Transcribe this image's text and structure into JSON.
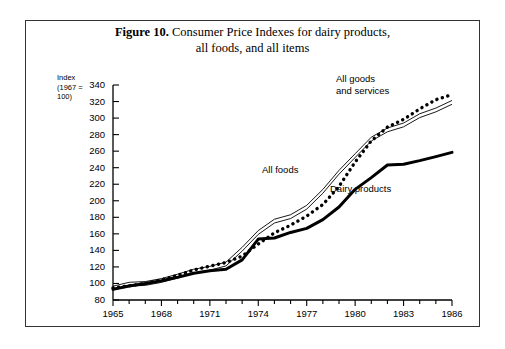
{
  "figure": {
    "number_label": "Figure 10.",
    "title_line1": "Consumer Price Indexes for dairy products,",
    "title_line2": "all foods, and all items"
  },
  "axis": {
    "y_label_line1": "Index",
    "y_label_line2": "(1967 =",
    "y_label_line3": "100)",
    "y_ticks": [
      "340",
      "320",
      "300",
      "280",
      "260",
      "240",
      "220",
      "200",
      "180",
      "160",
      "140",
      "120",
      "100",
      "80"
    ],
    "x_ticks": [
      "1965",
      "1968",
      "1971",
      "1974",
      "1977",
      "1980",
      "1983",
      "1986"
    ]
  },
  "annotations": {
    "all_goods_line1": "All goods",
    "all_goods_line2": "and services",
    "all_foods": "All foods",
    "dairy_products": "Dairy products"
  },
  "colors": {
    "ink": "#000000",
    "frame": "#333333",
    "background": "#ffffff"
  },
  "chart_data": {
    "type": "line",
    "title": "Figure 10. Consumer Price Indexes for dairy products, all foods, and all items",
    "xlabel": "",
    "ylabel": "Index (1967 = 100)",
    "xlim": [
      1965,
      1986
    ],
    "ylim": [
      80,
      340
    ],
    "y_tick_step": 20,
    "x_tick_step": 3,
    "grid": false,
    "legend": "inline-annotations",
    "x": [
      1965,
      1966,
      1967,
      1968,
      1969,
      1970,
      1971,
      1972,
      1973,
      1974,
      1975,
      1976,
      1977,
      1978,
      1979,
      1980,
      1981,
      1982,
      1983,
      1984,
      1985,
      1986
    ],
    "series": [
      {
        "name": "All goods and services",
        "style": "dotted",
        "values": [
          94.5,
          97.2,
          100.0,
          104.2,
          109.8,
          116.3,
          120.9,
          125.3,
          133.1,
          147.7,
          161.2,
          170.5,
          181.5,
          195.4,
          217.4,
          246.8,
          272.4,
          289.1,
          298.4,
          311.1,
          322.2,
          328.4
        ]
      },
      {
        "name": "All foods",
        "style": "double-thin",
        "values": [
          94.4,
          99.1,
          100.0,
          103.6,
          108.9,
          114.9,
          118.4,
          123.5,
          141.4,
          161.7,
          175.4,
          180.8,
          192.2,
          211.4,
          234.5,
          254.6,
          274.6,
          285.7,
          291.7,
          302.9,
          309.8,
          319.0
        ]
      },
      {
        "name": "Dairy products",
        "style": "thick-solid",
        "values": [
          93.0,
          97.0,
          100.0,
          103.2,
          107.4,
          112.3,
          115.4,
          117.2,
          128.5,
          153.7,
          155.0,
          161.7,
          166.6,
          177.2,
          192.4,
          213.8,
          228.0,
          243.2,
          244.2,
          248.5,
          253.4,
          258.5
        ]
      }
    ]
  }
}
